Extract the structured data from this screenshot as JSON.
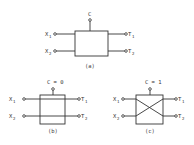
{
  "figure": {
    "panel_a": {
      "control_label": "C",
      "inputs": [
        {
          "base": "X",
          "sub": "1"
        },
        {
          "base": "X",
          "sub": "2"
        }
      ],
      "outputs": [
        {
          "base": "T",
          "sub": "1"
        },
        {
          "base": "T",
          "sub": "2"
        }
      ],
      "caption": "(a)"
    },
    "panel_b": {
      "control_label": "C = 0",
      "mode": "bar (straight-through)",
      "inputs": [
        {
          "base": "X",
          "sub": "1"
        },
        {
          "base": "X",
          "sub": "2"
        }
      ],
      "outputs": [
        {
          "base": "T",
          "sub": "1"
        },
        {
          "base": "T",
          "sub": "2"
        }
      ],
      "caption": "(b)"
    },
    "panel_c": {
      "control_label": "C = 1",
      "mode": "cross",
      "inputs": [
        {
          "base": "X",
          "sub": "1"
        },
        {
          "base": "X",
          "sub": "2"
        }
      ],
      "outputs": [
        {
          "base": "T",
          "sub": "1"
        },
        {
          "base": "T",
          "sub": "2"
        }
      ],
      "caption": "(c)"
    }
  }
}
